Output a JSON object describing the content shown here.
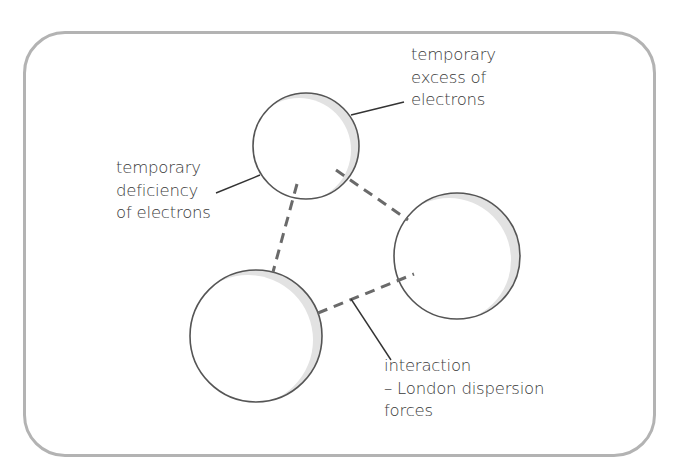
{
  "diagram": {
    "type": "molecular-interaction-schematic",
    "colors": {
      "frame_border": "#b3b3b3",
      "circle_stroke": "#555555",
      "circle_shade": "#e2e2e2",
      "dash_line": "#6a6a6a",
      "leader_line": "#333333",
      "text": "#3a3a3a",
      "background": "#ffffff"
    },
    "particles": [
      {
        "id": "top",
        "cx": 306,
        "cy": 146,
        "r": 53
      },
      {
        "id": "right",
        "cx": 457,
        "cy": 256,
        "r": 63
      },
      {
        "id": "bottom-left",
        "cx": 256,
        "cy": 336,
        "r": 66
      }
    ],
    "interactions": [
      {
        "from": "top",
        "to": "bottom-left",
        "x1": 297,
        "y1": 184,
        "x2": 273,
        "y2": 272
      },
      {
        "from": "top",
        "to": "right",
        "x1": 336,
        "y1": 170,
        "x2": 408,
        "y2": 220
      },
      {
        "from": "bottom-left",
        "to": "right",
        "x1": 318,
        "y1": 313,
        "x2": 414,
        "y2": 274
      }
    ],
    "labels": {
      "excess": {
        "lines": [
          "temporary",
          "excess of",
          "electrons"
        ],
        "leader": {
          "x1": 351,
          "y1": 115,
          "x2": 404,
          "y2": 102
        }
      },
      "deficiency": {
        "lines": [
          "temporary",
          "deficiency",
          "of electrons"
        ],
        "leader": {
          "x1": 216,
          "y1": 193,
          "x2": 260,
          "y2": 175
        }
      },
      "interaction": {
        "lines": [
          "interaction",
          "– London dispersion",
          "forces"
        ],
        "leader": {
          "x1": 351,
          "y1": 299,
          "x2": 391,
          "y2": 360
        }
      }
    }
  }
}
